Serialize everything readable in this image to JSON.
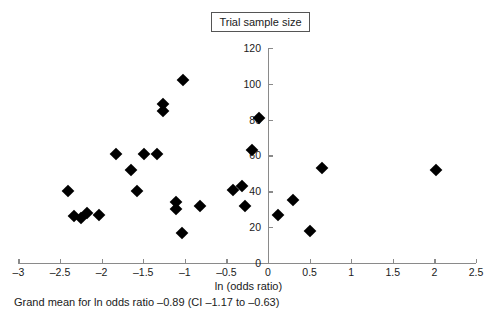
{
  "title": {
    "text": "Trial sample size"
  },
  "caption": {
    "text": "Grand mean for ln odds ratio –0.89 (CI –1.17 to –0.63)"
  },
  "chart_data": {
    "type": "scatter",
    "title": "Trial sample size",
    "xlabel": "ln (odds ratio)",
    "ylabel": "Trial sample size",
    "xlim": [
      -3,
      2.5
    ],
    "ylim": [
      0,
      120
    ],
    "grid": false,
    "legend": null,
    "xticks": [
      "–3",
      "–2.5",
      "–2",
      "–1.5",
      "–1",
      "–0.5",
      "0",
      "0.5",
      "1",
      "1.5",
      "2",
      "2.5"
    ],
    "xtick_values": [
      -3,
      -2.5,
      -2,
      -1.5,
      -1,
      -0.5,
      0,
      0.5,
      1,
      1.5,
      2,
      2.5
    ],
    "yticks": [
      "0",
      "20",
      "40",
      "60",
      "80",
      "100",
      "120"
    ],
    "ytick_values": [
      0,
      20,
      40,
      60,
      80,
      100,
      120
    ],
    "annotations": [
      "Grand mean for ln odds ratio –0.89 (CI –1.17 to –0.63)"
    ],
    "grand_mean": -0.89,
    "ci": [
      -1.17,
      -0.63
    ],
    "marker": "filled-diamond",
    "color": "#000000",
    "points": [
      {
        "x": -2.4,
        "y": 40
      },
      {
        "x": -2.33,
        "y": 26
      },
      {
        "x": -2.25,
        "y": 25
      },
      {
        "x": -2.17,
        "y": 28
      },
      {
        "x": -2.03,
        "y": 27
      },
      {
        "x": -1.83,
        "y": 61
      },
      {
        "x": -1.65,
        "y": 52
      },
      {
        "x": -1.57,
        "y": 40
      },
      {
        "x": -1.49,
        "y": 61
      },
      {
        "x": -1.33,
        "y": 61
      },
      {
        "x": -1.26,
        "y": 89
      },
      {
        "x": -1.26,
        "y": 85
      },
      {
        "x": -1.02,
        "y": 102
      },
      {
        "x": -1.1,
        "y": 34
      },
      {
        "x": -1.11,
        "y": 30
      },
      {
        "x": -1.03,
        "y": 17
      },
      {
        "x": -0.82,
        "y": 32
      },
      {
        "x": -0.42,
        "y": 41
      },
      {
        "x": -0.31,
        "y": 43
      },
      {
        "x": -0.28,
        "y": 32
      },
      {
        "x": -0.19,
        "y": 63
      },
      {
        "x": -0.11,
        "y": 81
      },
      {
        "x": 0.12,
        "y": 27
      },
      {
        "x": 0.3,
        "y": 35
      },
      {
        "x": 0.5,
        "y": 18
      },
      {
        "x": 0.65,
        "y": 53
      },
      {
        "x": 2.02,
        "y": 52
      }
    ]
  }
}
